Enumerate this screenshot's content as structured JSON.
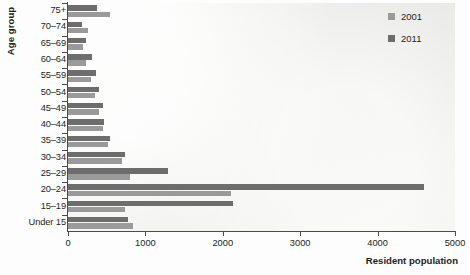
{
  "chart_data": {
    "type": "bar",
    "orientation": "horizontal",
    "title": "",
    "xlabel": "Resident population",
    "ylabel": "Age group",
    "xlim": [
      0,
      5000
    ],
    "xticks": [
      0,
      1000,
      2000,
      3000,
      4000,
      5000
    ],
    "xtick_labels": [
      "0",
      "1000",
      "2000",
      "3000",
      "4000",
      "5000"
    ],
    "grid": false,
    "legend_position": "top-right",
    "categories": [
      "75+",
      "70–74",
      "65–69",
      "60–64",
      "55–59",
      "50–54",
      "45–49",
      "40–44",
      "35–39",
      "30–34",
      "25–29",
      "20–24",
      "15–19",
      "Under 15"
    ],
    "series": [
      {
        "name": "2001",
        "color": "#9a9a9a",
        "values": [
          545,
          255,
          195,
          235,
          295,
          350,
          400,
          450,
          515,
          700,
          800,
          2110,
          735,
          840
        ]
      },
      {
        "name": "2011",
        "color": "#6d6d6d",
        "values": [
          375,
          180,
          235,
          310,
          360,
          400,
          450,
          465,
          540,
          735,
          1290,
          4605,
          2130,
          775
        ]
      }
    ]
  },
  "legend": {
    "entries": [
      {
        "label": "2001",
        "color": "#9a9a9a"
      },
      {
        "label": "2011",
        "color": "#6d6d6d"
      }
    ]
  },
  "axis": {
    "y_title": "Age group",
    "x_title": "Resident population"
  }
}
